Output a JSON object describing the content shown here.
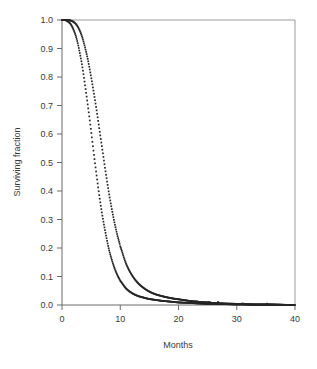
{
  "chart_data": {
    "type": "line",
    "title": "",
    "xlabel": "Months",
    "ylabel": "Surviving fraction",
    "xlim": [
      0,
      40
    ],
    "ylim": [
      0.0,
      1.0
    ],
    "grid": false,
    "legend": "none",
    "marker_style": "small dense dots forming a continuous curve",
    "line_color": "#262626",
    "frame_color": "#9a9a9a",
    "xticks": [
      0,
      10,
      20,
      30,
      40
    ],
    "xtick_labels": [
      "0",
      "10",
      "20",
      "30",
      "40"
    ],
    "yticks": [
      0.0,
      0.1,
      0.2,
      0.3,
      0.4,
      0.5,
      0.6,
      0.7,
      0.8,
      0.9,
      1.0
    ],
    "ytick_labels": [
      "0.0",
      "0.1",
      "0.2",
      "0.3",
      "0.4",
      "0.5",
      "0.6",
      "0.7",
      "0.8",
      "0.9",
      "1.0"
    ],
    "x": [
      0,
      0.5,
      1,
      1.5,
      2,
      2.5,
      3,
      3.5,
      4,
      4.5,
      5,
      5.5,
      6,
      6.5,
      7,
      7.5,
      8,
      8.5,
      9,
      9.5,
      10,
      11,
      12,
      13,
      14,
      15,
      16,
      17,
      18,
      19,
      20,
      21,
      22,
      23,
      24,
      25,
      26,
      27,
      28,
      30,
      31,
      33,
      35,
      37,
      40
    ],
    "series": [
      {
        "name": "Curve A (steeper decline)",
        "values": [
          1.0,
          1.0,
          0.995,
          0.985,
          0.965,
          0.935,
          0.89,
          0.835,
          0.765,
          0.69,
          0.61,
          0.525,
          0.445,
          0.37,
          0.305,
          0.25,
          0.2,
          0.162,
          0.13,
          0.105,
          0.085,
          0.058,
          0.042,
          0.032,
          0.026,
          0.021,
          0.018,
          0.015,
          0.013,
          0.011,
          0.009,
          0.008,
          0.007,
          0.006,
          0.005,
          0.004,
          0.004,
          0.003,
          0.003,
          0.002,
          0.002,
          0.001,
          0.001,
          0.001,
          0.0
        ]
      },
      {
        "name": "Curve B (shallower decline)",
        "values": [
          1.0,
          1.0,
          1.0,
          0.998,
          0.993,
          0.983,
          0.965,
          0.938,
          0.9,
          0.855,
          0.8,
          0.74,
          0.675,
          0.605,
          0.535,
          0.465,
          0.4,
          0.342,
          0.29,
          0.245,
          0.205,
          0.145,
          0.105,
          0.078,
          0.06,
          0.047,
          0.038,
          0.032,
          0.027,
          0.023,
          0.02,
          0.017,
          0.014,
          0.012,
          0.01,
          0.009,
          0.007,
          0.006,
          0.005,
          0.004,
          0.003,
          0.002,
          0.002,
          0.001,
          0.0
        ]
      }
    ],
    "tail_markers": {
      "note": "sparse isolated dots along the baseline",
      "points": [
        {
          "x": 23.2,
          "y": 0.012
        },
        {
          "x": 25.3,
          "y": 0.01
        },
        {
          "x": 26.8,
          "y": 0.01
        },
        {
          "x": 31.0,
          "y": 0.005
        },
        {
          "x": 35.2,
          "y": 0.004
        }
      ]
    }
  },
  "axes": {
    "x_title": "Months",
    "y_title": "Surviving fraction"
  }
}
